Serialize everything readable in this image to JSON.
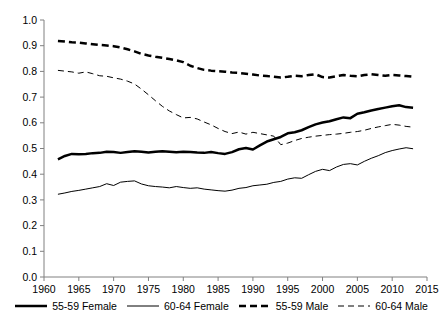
{
  "chart_data": {
    "type": "line",
    "title": "",
    "subtitle": "",
    "xlabel": "",
    "ylabel": "",
    "xlim": [
      1960,
      2015
    ],
    "ylim": [
      0.0,
      1.0
    ],
    "grid": false,
    "legend_position": "bottom",
    "y_ticks": [
      "0.0",
      "0.1",
      "0.2",
      "0.3",
      "0.4",
      "0.5",
      "0.6",
      "0.7",
      "0.8",
      "0.9",
      "1.0"
    ],
    "x_ticks": [
      "1960",
      "1965",
      "1970",
      "1975",
      "1980",
      "1985",
      "1990",
      "1995",
      "2000",
      "2005",
      "2010",
      "2015"
    ],
    "x": [
      1962,
      1963,
      1964,
      1965,
      1966,
      1967,
      1968,
      1969,
      1970,
      1971,
      1972,
      1973,
      1974,
      1975,
      1976,
      1977,
      1978,
      1979,
      1980,
      1981,
      1982,
      1983,
      1984,
      1985,
      1986,
      1987,
      1988,
      1989,
      1990,
      1991,
      1992,
      1993,
      1994,
      1995,
      1996,
      1997,
      1998,
      1999,
      2000,
      2001,
      2002,
      2003,
      2004,
      2005,
      2006,
      2007,
      2008,
      2009,
      2010,
      2011,
      2012,
      2013
    ],
    "series": [
      {
        "name": "55-59 Female",
        "style": "thick-solid",
        "color": "#000000",
        "values": [
          0.458,
          0.471,
          0.479,
          0.478,
          0.479,
          0.482,
          0.483,
          0.487,
          0.486,
          0.483,
          0.486,
          0.489,
          0.487,
          0.484,
          0.487,
          0.489,
          0.487,
          0.485,
          0.487,
          0.486,
          0.484,
          0.483,
          0.486,
          0.482,
          0.479,
          0.486,
          0.497,
          0.502,
          0.496,
          0.512,
          0.527,
          0.536,
          0.545,
          0.559,
          0.563,
          0.571,
          0.583,
          0.594,
          0.601,
          0.606,
          0.614,
          0.621,
          0.618,
          0.635,
          0.641,
          0.648,
          0.654,
          0.659,
          0.664,
          0.668,
          0.661,
          0.659
        ]
      },
      {
        "name": "60-64 Female",
        "style": "thin-solid",
        "color": "#000000",
        "values": [
          0.322,
          0.327,
          0.333,
          0.337,
          0.342,
          0.347,
          0.352,
          0.363,
          0.356,
          0.369,
          0.372,
          0.374,
          0.362,
          0.355,
          0.352,
          0.35,
          0.347,
          0.352,
          0.348,
          0.345,
          0.347,
          0.342,
          0.339,
          0.336,
          0.334,
          0.338,
          0.345,
          0.348,
          0.355,
          0.358,
          0.361,
          0.368,
          0.372,
          0.381,
          0.386,
          0.384,
          0.398,
          0.411,
          0.419,
          0.414,
          0.428,
          0.438,
          0.441,
          0.436,
          0.45,
          0.462,
          0.472,
          0.484,
          0.492,
          0.498,
          0.503,
          0.499
        ]
      },
      {
        "name": "55-59 Male",
        "style": "thick-dashed",
        "color": "#000000",
        "values": [
          0.918,
          0.916,
          0.913,
          0.912,
          0.909,
          0.906,
          0.903,
          0.901,
          0.898,
          0.893,
          0.886,
          0.878,
          0.868,
          0.862,
          0.857,
          0.853,
          0.848,
          0.843,
          0.836,
          0.822,
          0.813,
          0.806,
          0.803,
          0.801,
          0.799,
          0.796,
          0.794,
          0.791,
          0.788,
          0.784,
          0.782,
          0.779,
          0.776,
          0.779,
          0.783,
          0.781,
          0.786,
          0.789,
          0.778,
          0.776,
          0.781,
          0.786,
          0.783,
          0.781,
          0.786,
          0.789,
          0.786,
          0.783,
          0.786,
          0.784,
          0.782,
          0.779
        ]
      },
      {
        "name": "60-64 Male",
        "style": "thin-dashed",
        "color": "#000000",
        "values": [
          0.804,
          0.801,
          0.798,
          0.793,
          0.798,
          0.791,
          0.783,
          0.781,
          0.775,
          0.77,
          0.762,
          0.751,
          0.731,
          0.709,
          0.686,
          0.664,
          0.646,
          0.632,
          0.619,
          0.621,
          0.615,
          0.603,
          0.592,
          0.578,
          0.566,
          0.558,
          0.564,
          0.556,
          0.563,
          0.558,
          0.553,
          0.548,
          0.515,
          0.521,
          0.531,
          0.539,
          0.544,
          0.548,
          0.551,
          0.554,
          0.556,
          0.559,
          0.563,
          0.566,
          0.571,
          0.578,
          0.584,
          0.589,
          0.594,
          0.591,
          0.586,
          0.583
        ]
      }
    ]
  },
  "legend": {
    "items": [
      {
        "label": "55-59 Female",
        "swatch": "thick-solid"
      },
      {
        "label": "60-64 Female",
        "swatch": "thin-solid"
      },
      {
        "label": "55-59 Male",
        "swatch": "thick-dashed"
      },
      {
        "label": "60-64 Male",
        "swatch": "thin-dashed"
      }
    ]
  }
}
